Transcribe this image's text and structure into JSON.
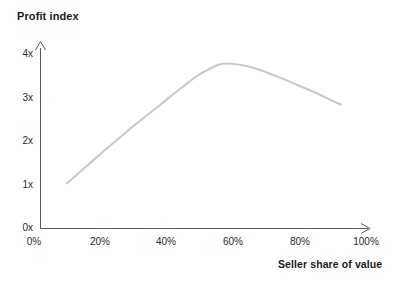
{
  "chart_data": {
    "type": "line",
    "title": "Profit index",
    "xlabel": "Seller share of value",
    "ylabel": "Profit index",
    "grid": false,
    "legend": null,
    "xlim": [
      0,
      100
    ],
    "ylim": [
      0,
      4
    ],
    "x_tick_labels": [
      "0%",
      "20%",
      "40%",
      "60%",
      "80%",
      "100%"
    ],
    "x_tick_values": [
      0,
      20,
      40,
      60,
      80,
      100
    ],
    "y_tick_labels": [
      "0x",
      "1x",
      "2x",
      "3x",
      "4x"
    ],
    "y_tick_values": [
      0,
      1,
      2,
      3,
      4
    ],
    "x": [
      10,
      15,
      20,
      25,
      30,
      35,
      40,
      45,
      50,
      55,
      57,
      60,
      65,
      70,
      75,
      80,
      85,
      90,
      93
    ],
    "y": [
      1.0,
      1.33,
      1.66,
      1.98,
      2.3,
      2.6,
      2.9,
      3.2,
      3.48,
      3.68,
      3.73,
      3.73,
      3.67,
      3.55,
      3.4,
      3.24,
      3.08,
      2.9,
      2.8
    ],
    "series": [
      {
        "name": "Profit index",
        "color": "#c9c9c9",
        "x": [
          10,
          15,
          20,
          25,
          30,
          35,
          40,
          45,
          50,
          55,
          57,
          60,
          65,
          70,
          75,
          80,
          85,
          90,
          93
        ],
        "values": [
          1.0,
          1.33,
          1.66,
          1.98,
          2.3,
          2.6,
          2.9,
          3.2,
          3.48,
          3.68,
          3.73,
          3.73,
          3.67,
          3.55,
          3.4,
          3.24,
          3.08,
          2.9,
          2.8
        ]
      }
    ],
    "annotations": {
      "curve_start": "10%, 1x",
      "curve_peak": "57%, 3.7x",
      "curve_end": "93%, 2.8x"
    },
    "axis_color": "#5a5a5a",
    "curve_color": "#c9c9c9",
    "text_color": "#1a1a1a",
    "background": "#ffffff"
  }
}
